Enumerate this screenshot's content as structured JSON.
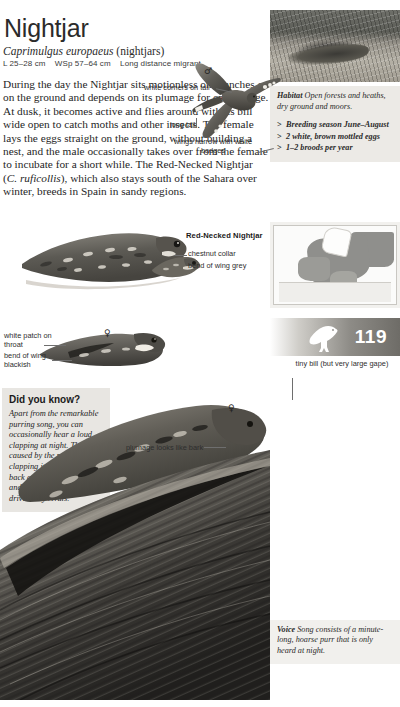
{
  "header": {
    "title": "Nightjar",
    "latin_name": "Caprimulgus europaeus",
    "family": "(nightjars)",
    "length": "L 25–28 cm",
    "wingspan": "WSp 57–64 cm",
    "migration": "Long distance migrant"
  },
  "description": {
    "text": "During the day the Nightjar sits motionless on branches or on the ground and depends on its plumage for camouflage. At dusk, it becomes active and flies around with its bill wide open to catch moths and other insects. The female lays the eggs straight on the ground, without building a nest, and the male occasionally takes over from the female to incubate for a short while. The Red-Necked Nightjar (C. ruficollis), which also stays south of the Sahara over winter, breeds in Spain in sandy regions.",
    "italic_fragment": "C. ruficollis"
  },
  "info_box": {
    "habitat_label": "Habitat",
    "habitat_text": "Open forests and heaths, dry ground and moors.",
    "bullets": [
      "Breeding season June–August",
      "2 white, brown mottled eggs",
      "1–2 broods per year"
    ]
  },
  "voice_box": {
    "label": "Voice",
    "text": "Song consists of a minute-long, hoarse purr that is only heard at night."
  },
  "did_you_know": {
    "title": "Did you know?",
    "text": "Apart from the remarkable purring song, you can occasionally hear a loud clapping at night. This is caused by the male clapping its wings above its back as a courtship display and is also designed to drive away rivals."
  },
  "page_banner": {
    "number": "119",
    "icon": "bird-silhouette-icon"
  },
  "annotations": {
    "white_corners": "white corners on tail",
    "long_tail": "long tail",
    "wings_narrow": "wings narrow with white badges",
    "chestnut_collar": "chestnut collar",
    "bend_of_wing_grey": "bend of wing grey",
    "white_patch": "white patch on throat",
    "bend_of_wing_blackish": "bend of wing blackish",
    "tiny_bill": "tiny bill (but very large gape)",
    "plumage_bark": "plumage looks like bark"
  },
  "labels": {
    "red_necked_nightjar": "Red-Necked Nightjar"
  },
  "symbols": {
    "male": "♂",
    "female": "♀"
  },
  "figures": {
    "photo_top": "nightjar-on-ground-photo",
    "range_map": "europe-distribution-map",
    "flying_bird": "nightjar-in-flight-illustration",
    "perched_bird_1": "nightjar-perched-illustration",
    "red_necked_bird": "red-necked-nightjar-illustration",
    "perched_bird_2": "nightjar-head-detail-illustration",
    "bark_scene": "nightjar-camouflaged-on-bark-illustration"
  }
}
